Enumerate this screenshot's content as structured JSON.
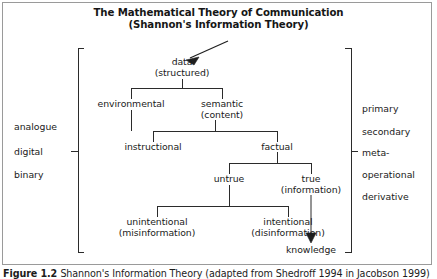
{
  "figure": {
    "title_line1": "The Mathematical Theory of Communication",
    "title_line2": "(Shannon's Information Theory)",
    "caption_label": "Figure 1.2",
    "caption_text": "Shannon's Information Theory (adapted from Shedroff 1994 in Jacobson 1999)"
  },
  "nodes": {
    "data": {
      "line1": "data",
      "line2": "(structured)"
    },
    "environmental": {
      "line1": "environmental",
      "line2": ""
    },
    "semantic": {
      "line1": "semantic",
      "line2": "(content)"
    },
    "instructional": {
      "line1": "instructional",
      "line2": ""
    },
    "factual": {
      "line1": "factual",
      "line2": ""
    },
    "untrue": {
      "line1": "untrue",
      "line2": ""
    },
    "true": {
      "line1": "true",
      "line2": "(information)"
    },
    "unintentional": {
      "line1": "unintentional",
      "line2": "(misinformation)"
    },
    "intentional": {
      "line1": "intentional",
      "line2": "(disinformation)"
    },
    "knowledge": {
      "line1": "knowledge",
      "line2": ""
    }
  },
  "left_labels": [
    "analogue",
    "digital",
    "binary"
  ],
  "right_labels": [
    "primary",
    "secondary",
    "meta-",
    "operational",
    "derivative"
  ],
  "colors": {
    "line": "#2b2b2b",
    "text": "#1a1a1a",
    "frame": "#9a9a9a",
    "background": "#ffffff"
  }
}
